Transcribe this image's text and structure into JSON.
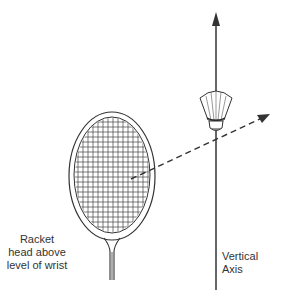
{
  "diagram": {
    "labels": {
      "racket": [
        "Racket",
        "head above",
        "level of wrist"
      ],
      "axis": [
        "Vertical",
        "Axis"
      ]
    },
    "colors": {
      "line": "#333333",
      "background": "#ffffff"
    },
    "elements": [
      "badminton-racket",
      "shuttlecock",
      "vertical-axis-arrow",
      "dashed-trajectory-arrow"
    ]
  }
}
